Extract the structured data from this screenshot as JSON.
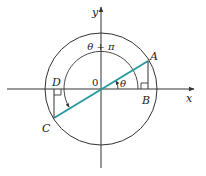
{
  "diagram": {
    "colors": {
      "ink": "#333333",
      "segment": "#2a9aa0",
      "background": "#ffffff"
    },
    "axes": {
      "x_label": "x",
      "y_label": "y",
      "origin_label": "0"
    },
    "points": {
      "A": "A",
      "B": "B",
      "C": "C",
      "D": "D"
    },
    "angles": {
      "theta": "θ",
      "theta_plus_pi": "θ + π"
    }
  }
}
